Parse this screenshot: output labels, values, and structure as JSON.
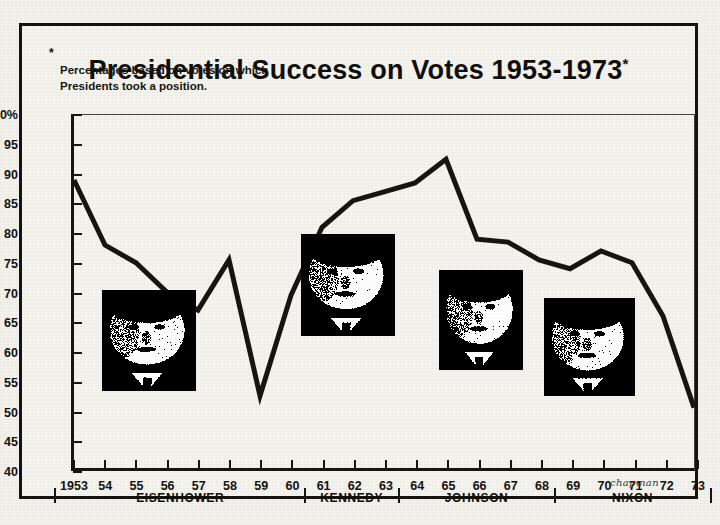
{
  "title": {
    "text": "Presidential Success on Votes 1953-1973",
    "star": "*"
  },
  "footnote": {
    "star": "*",
    "text": "Percentages based on votes on which\nPresidents took a position."
  },
  "signature": "chapman",
  "chart_data": {
    "type": "line",
    "title": "Presidential Success on Votes 1953-1973*",
    "xlabel": "",
    "ylabel": "",
    "ylim": [
      40,
      100
    ],
    "ytick_values": [
      40,
      45,
      50,
      55,
      60,
      65,
      70,
      75,
      80,
      85,
      90,
      95,
      100
    ],
    "ytick_labels": [
      "40",
      "45",
      "50",
      "55",
      "60",
      "65",
      "70",
      "75",
      "80",
      "85",
      "90",
      "95",
      "100%"
    ],
    "x": [
      1953,
      1954,
      1955,
      1956,
      1957,
      1958,
      1959,
      1960,
      1961,
      1962,
      1963,
      1964,
      1965,
      1966,
      1967,
      1968,
      1969,
      1970,
      1971,
      1972,
      1973
    ],
    "xtick_labels": [
      "1953",
      "54",
      "55",
      "56",
      "57",
      "58",
      "59",
      "60",
      "61",
      "62",
      "63",
      "64",
      "65",
      "66",
      "67",
      "68",
      "69",
      "70",
      "71",
      "72",
      "73"
    ],
    "values": [
      89,
      78,
      75,
      70,
      67,
      75.5,
      52.5,
      69.5,
      81,
      85.5,
      87,
      88.5,
      92.5,
      79,
      78.5,
      75.5,
      74,
      77,
      75,
      66,
      50.5
    ],
    "grid": false,
    "legend": null,
    "line_color": "#17150f"
  },
  "presidents": [
    {
      "name": "EISENHOWER",
      "start": 1953,
      "end": 1960
    },
    {
      "name": "KENNEDY",
      "start": 1961,
      "end": 1963
    },
    {
      "name": "JOHNSON",
      "start": 1964,
      "end": 1968
    },
    {
      "name": "NIXON",
      "start": 1969,
      "end": 1973
    }
  ],
  "photos": [
    {
      "name": "eisenhower-photo",
      "label": "Dwight D. Eisenhower",
      "x": 99,
      "y": 287,
      "w": 94,
      "h": 101
    },
    {
      "name": "kennedy-photo",
      "label": "John F. Kennedy",
      "x": 298,
      "y": 231,
      "w": 94,
      "h": 102
    },
    {
      "name": "johnson-photo",
      "label": "Lyndon B. Johnson",
      "x": 436,
      "y": 267,
      "w": 84,
      "h": 100
    },
    {
      "name": "nixon-photo",
      "label": "Richard M. Nixon",
      "x": 541,
      "y": 295,
      "w": 91,
      "h": 98
    }
  ],
  "colors": {
    "ink": "#17150f",
    "paper": "#f4f3ee",
    "frame": "#14130f"
  }
}
